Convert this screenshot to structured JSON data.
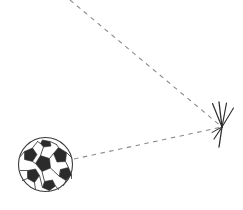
{
  "figure": {
    "title": "",
    "background_color": "#ffffff",
    "width": 243,
    "height": 210
  },
  "chart_data": {
    "type": "scatter",
    "title": "",
    "xlabel": "",
    "ylabel": "",
    "xlim": [
      0,
      243
    ],
    "ylim": [
      210,
      0
    ],
    "grid": false,
    "legend": "none",
    "objects": [
      {
        "name": "soccer-ball",
        "type": "ball",
        "center": [
          45.5,
          164.5
        ],
        "radius": 27.5,
        "outline_color": "#3a3a3a",
        "panel_dark_color": "#2b2b2b",
        "panel_light_color": "#ffffff"
      },
      {
        "name": "impact-point",
        "type": "burst",
        "center": [
          222,
          127
        ],
        "ray_count": 7,
        "color": "#2e2e2e"
      }
    ],
    "series": [
      {
        "name": "incoming-trajectory",
        "style": "dashed",
        "color": "#8a8a92",
        "x": [
          70,
          222
        ],
        "y": [
          0,
          127
        ]
      },
      {
        "name": "outgoing-trajectory",
        "style": "dashed",
        "color": "#8a8a92",
        "x": [
          74,
          222
        ],
        "y": [
          159,
          127
        ]
      }
    ]
  },
  "annotations": {
    "ball_label": "",
    "impact_label": "",
    "path_label": ""
  }
}
